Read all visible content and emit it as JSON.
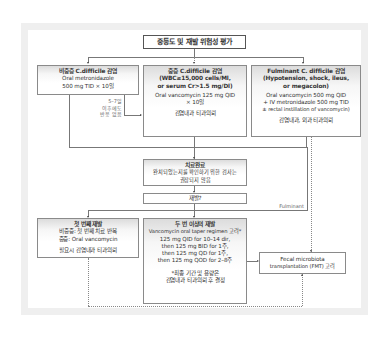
{
  "title": "중등도 및 재발 위험성 평가",
  "boxes": {
    "nonsevere": {
      "heading": "비중증 C.difficile 감염",
      "lines": [
        "Oral metronidazole",
        "500 mg TID × 10일"
      ]
    },
    "severe": {
      "heading_lines": [
        "중증 C.difficile 감염",
        "(WBC≥15,000 cells/Ml,",
        "or serum Cr>1.5 mg/Dl)"
      ],
      "lines": [
        "Oral vancomycin 125 mg QID",
        "× 10일"
      ],
      "note": "감염내과 티과의뢰"
    },
    "fulminant": {
      "heading_lines": [
        "Fulminant C. difficile 감염",
        "(Hypotension, shock, ileus,",
        "or megacolon)"
      ],
      "lines": [
        "Oral vancomycin 500 mg QID",
        "+ IV metronidazole 500 mg TID",
        "± rectal instillation of vancomycin)"
      ],
      "note": "감염내과, 외과 티과의뢰"
    },
    "complete": {
      "heading": "치료완료",
      "lines": [
        "완치되었는지를 확인하기 위한 검사는",
        "권장되지 않음"
      ]
    },
    "recur": {
      "label": "재발?"
    },
    "first_recur": {
      "heading": "첫 번째 재발",
      "lines": [
        "비중증: 첫 번째 치료 반복",
        "중증: Oral vancomycin"
      ],
      "note": "필요시 감염내과 티과의뢰"
    },
    "second_recur": {
      "heading": "두 번 이상의 재발",
      "lines": [
        "Vancomycin oral taper regimen 고려*",
        "125 mg QID for 10–14 dir,",
        "then 125 mg BID for 1주,",
        "then 125 mg QD for 1주,",
        "then 125 mg QOD for 2–8주"
      ],
      "note_lines": [
        "*최종 기간 및 용량은",
        "감염내과 티과의뢰 후 결정"
      ]
    },
    "fmt": {
      "lines": [
        "Fecal microbiota",
        "transplantation (FMT) 고려"
      ]
    }
  },
  "labels": {
    "no_response": [
      "5–7일",
      "이후에도",
      "반응 없음"
    ],
    "fulminant": "Fulminant"
  },
  "colors": {
    "border": "#8a8a8a",
    "frame": "#efefef",
    "line": "#777777"
  }
}
